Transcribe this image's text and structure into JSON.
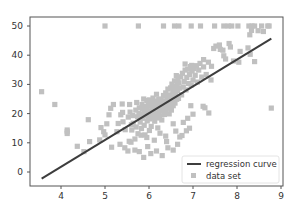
{
  "chart_data": {
    "type": "scatter",
    "title": "",
    "xlabel": "",
    "ylabel": "",
    "xlim": [
      3.45,
      9.05
    ],
    "ylim": [
      -5,
      52
    ],
    "grid": false,
    "legend_position": "lower right",
    "x_ticks": [
      4,
      5,
      6,
      7,
      8,
      9
    ],
    "y_ticks": [
      0,
      10,
      20,
      30,
      40,
      50
    ],
    "colors": {
      "line": "#3d3d3d",
      "points": "#c0c0c0",
      "axes": "#555555"
    },
    "series": [
      {
        "name": "regression curve",
        "type": "line",
        "x": [
          3.56,
          8.78
        ],
        "y": [
          -2.3,
          45.7
        ]
      },
      {
        "name": "data set",
        "type": "scatter",
        "marker": "square",
        "points": [
          [
            3.56,
            27.5
          ],
          [
            3.86,
            23.1
          ],
          [
            4.14,
            13.8
          ],
          [
            4.14,
            13.2
          ],
          [
            4.14,
            14.4
          ],
          [
            4.37,
            8.8
          ],
          [
            4.52,
            7.0
          ],
          [
            4.62,
            17.9
          ],
          [
            4.65,
            10.4
          ],
          [
            4.88,
            11.0
          ],
          [
            4.91,
            15.2
          ],
          [
            4.97,
            13.8
          ],
          [
            5.0,
            12.7
          ],
          [
            5.04,
            16.5
          ],
          [
            5.09,
            19.6
          ],
          [
            5.13,
            21.8
          ],
          [
            5.15,
            8.5
          ],
          [
            5.19,
            23.1
          ],
          [
            5.27,
            13.8
          ],
          [
            5.3,
            16.6
          ],
          [
            5.34,
            9.5
          ],
          [
            5.36,
            19.6
          ],
          [
            5.39,
            23.3
          ],
          [
            5.4,
            20.4
          ],
          [
            5.41,
            17.2
          ],
          [
            5.45,
            8.3
          ],
          [
            5.46,
            14.5
          ],
          [
            5.52,
            7.2
          ],
          [
            5.53,
            18.8
          ],
          [
            5.56,
            23.1
          ],
          [
            5.57,
            20.5
          ],
          [
            5.59,
            10.2
          ],
          [
            5.6,
            16.2
          ],
          [
            5.61,
            14.4
          ],
          [
            5.63,
            19.3
          ],
          [
            5.64,
            16.7
          ],
          [
            5.68,
            11.3
          ],
          [
            5.7,
            21.2
          ],
          [
            5.71,
            15.4
          ],
          [
            5.72,
            23.8
          ],
          [
            5.74,
            18.9
          ],
          [
            5.75,
            13.1
          ],
          [
            5.77,
            20.0
          ],
          [
            5.78,
            22.0
          ],
          [
            5.8,
            17.1
          ],
          [
            5.81,
            19.5
          ],
          [
            5.83,
            14.9
          ],
          [
            5.84,
            23.1
          ],
          [
            5.85,
            21.7
          ],
          [
            5.86,
            18.4
          ],
          [
            5.87,
            19.9
          ],
          [
            5.88,
            25.0
          ],
          [
            5.89,
            16.0
          ],
          [
            5.9,
            20.8
          ],
          [
            5.91,
            12.7
          ],
          [
            5.92,
            22.4
          ],
          [
            5.93,
            19.4
          ],
          [
            5.94,
            21.6
          ],
          [
            5.95,
            24.5
          ],
          [
            5.96,
            17.5
          ],
          [
            5.97,
            20.2
          ],
          [
            5.98,
            23.4
          ],
          [
            5.99,
            19.0
          ],
          [
            6.0,
            21.0
          ],
          [
            6.01,
            24.7
          ],
          [
            6.02,
            18.2
          ],
          [
            6.03,
            22.6
          ],
          [
            6.04,
            20.3
          ],
          [
            6.05,
            15.6
          ],
          [
            6.06,
            23.9
          ],
          [
            6.07,
            19.8
          ],
          [
            6.08,
            21.4
          ],
          [
            6.09,
            25.3
          ],
          [
            6.1,
            18.7
          ],
          [
            6.11,
            20.6
          ],
          [
            6.12,
            22.9
          ],
          [
            6.13,
            17.4
          ],
          [
            6.14,
            24.2
          ],
          [
            6.15,
            19.4
          ],
          [
            6.16,
            21.9
          ],
          [
            6.17,
            26.6
          ],
          [
            6.18,
            20.1
          ],
          [
            6.19,
            23.2
          ],
          [
            6.2,
            18.5
          ],
          [
            6.21,
            22.2
          ],
          [
            6.22,
            24.8
          ],
          [
            6.23,
            20.7
          ],
          [
            6.24,
            19.1
          ],
          [
            6.25,
            23.6
          ],
          [
            6.26,
            21.1
          ],
          [
            6.27,
            25.0
          ],
          [
            6.28,
            22.5
          ],
          [
            6.29,
            17.8
          ],
          [
            6.3,
            24.4
          ],
          [
            6.31,
            20.9
          ],
          [
            6.32,
            23.0
          ],
          [
            6.33,
            26.2
          ],
          [
            6.34,
            21.5
          ],
          [
            6.35,
            19.7
          ],
          [
            6.36,
            24.1
          ],
          [
            6.37,
            22.8
          ],
          [
            6.38,
            27.1
          ],
          [
            6.39,
            20.4
          ],
          [
            6.4,
            23.8
          ],
          [
            6.41,
            25.6
          ],
          [
            6.42,
            21.8
          ],
          [
            6.43,
            28.4
          ],
          [
            6.44,
            24.6
          ],
          [
            6.45,
            22.3
          ],
          [
            6.46,
            19.9
          ],
          [
            6.47,
            26.4
          ],
          [
            6.48,
            23.4
          ],
          [
            6.49,
            28.8
          ],
          [
            6.5,
            25.1
          ],
          [
            6.51,
            21.2
          ],
          [
            6.52,
            30.1
          ],
          [
            6.53,
            24.0
          ],
          [
            6.54,
            27.5
          ],
          [
            6.55,
            22.7
          ],
          [
            6.56,
            29.3
          ],
          [
            6.57,
            25.8
          ],
          [
            6.58,
            31.2
          ],
          [
            6.59,
            23.6
          ],
          [
            6.6,
            28.0
          ],
          [
            6.61,
            26.7
          ],
          [
            6.62,
            33.0
          ],
          [
            6.63,
            24.9
          ],
          [
            6.64,
            29.6
          ],
          [
            6.65,
            27.9
          ],
          [
            6.66,
            31.8
          ],
          [
            6.67,
            25.2
          ],
          [
            6.68,
            30.5
          ],
          [
            6.7,
            28.7
          ],
          [
            6.72,
            32.6
          ],
          [
            6.74,
            26.4
          ],
          [
            6.76,
            33.8
          ],
          [
            6.78,
            29.1
          ],
          [
            6.8,
            31.0
          ],
          [
            6.82,
            34.9
          ],
          [
            6.84,
            28.1
          ],
          [
            6.86,
            32.4
          ],
          [
            6.88,
            35.2
          ],
          [
            6.9,
            30.3
          ],
          [
            6.92,
            33.4
          ],
          [
            6.94,
            36.1
          ],
          [
            6.96,
            29.8
          ],
          [
            6.98,
            34.6
          ],
          [
            7.0,
            31.5
          ],
          [
            7.02,
            35.4
          ],
          [
            7.05,
            33.1
          ],
          [
            7.08,
            36.4
          ],
          [
            7.1,
            30.8
          ],
          [
            7.13,
            34.9
          ],
          [
            7.16,
            37.2
          ],
          [
            7.2,
            32.5
          ],
          [
            7.24,
            36.0
          ],
          [
            7.3,
            33.4
          ],
          [
            7.35,
            37.6
          ],
          [
            7.42,
            36.2
          ],
          [
            7.47,
            42.3
          ],
          [
            7.52,
            43.1
          ],
          [
            7.6,
            43.5
          ],
          [
            7.62,
            42.0
          ],
          [
            7.68,
            41.7
          ],
          [
            7.7,
            39.8
          ],
          [
            7.74,
            38.7
          ],
          [
            7.82,
            44.0
          ],
          [
            7.85,
            42.8
          ],
          [
            7.92,
            38.0
          ],
          [
            8.04,
            37.6
          ],
          [
            8.07,
            41.3
          ],
          [
            8.25,
            42.5
          ],
          [
            8.3,
            40.3
          ],
          [
            8.4,
            37.8
          ],
          [
            8.48,
            48.4
          ],
          [
            8.56,
            50.0
          ],
          [
            8.6,
            48.1
          ],
          [
            8.7,
            50.0
          ],
          [
            8.78,
            21.9
          ],
          [
            5.0,
            50.0
          ],
          [
            5.76,
            50.0
          ],
          [
            6.33,
            50.0
          ],
          [
            6.58,
            50.0
          ],
          [
            6.68,
            50.0
          ],
          [
            6.96,
            50.0
          ],
          [
            7.17,
            50.0
          ],
          [
            7.49,
            50.0
          ],
          [
            7.7,
            50.0
          ],
          [
            7.8,
            50.0
          ],
          [
            7.88,
            50.0
          ],
          [
            8.02,
            50.0
          ],
          [
            8.27,
            50.0
          ],
          [
            8.34,
            50.0
          ],
          [
            8.4,
            50.0
          ],
          [
            8.73,
            50.0
          ],
          [
            8.29,
            47.0
          ],
          [
            8.33,
            48.5
          ],
          [
            6.82,
            37.0
          ],
          [
            6.97,
            36.5
          ],
          [
            7.24,
            38.5
          ],
          [
            7.41,
            31.5
          ],
          [
            7.23,
            22.5
          ],
          [
            6.95,
            22.7
          ],
          [
            7.0,
            19.8
          ],
          [
            7.36,
            20.2
          ],
          [
            7.27,
            22.0
          ],
          [
            6.4,
            10.4
          ],
          [
            6.55,
            7.5
          ],
          [
            6.65,
            9.5
          ],
          [
            6.7,
            12.0
          ],
          [
            6.85,
            14.1
          ],
          [
            6.43,
            8.3
          ],
          [
            6.3,
            5.6
          ],
          [
            6.17,
            7.2
          ],
          [
            6.04,
            6.3
          ],
          [
            5.97,
            8.7
          ],
          [
            5.88,
            5.0
          ],
          [
            5.78,
            7.0
          ],
          [
            5.68,
            7.5
          ],
          [
            5.55,
            10.5
          ],
          [
            6.75,
            12.5
          ],
          [
            6.92,
            15.0
          ],
          [
            6.61,
            14.0
          ],
          [
            6.38,
            12.3
          ],
          [
            6.25,
            13.3
          ],
          [
            6.12,
            10.9
          ],
          [
            5.95,
            11.8
          ],
          [
            5.82,
            12.6
          ],
          [
            6.55,
            16.5
          ],
          [
            6.78,
            17.0
          ],
          [
            6.88,
            18.4
          ],
          [
            6.2,
            15.1
          ],
          [
            6.01,
            14.2
          ]
        ]
      }
    ]
  },
  "legend": {
    "items": [
      {
        "label": "regression curve",
        "kind": "line"
      },
      {
        "label": "data set",
        "kind": "square"
      }
    ]
  }
}
